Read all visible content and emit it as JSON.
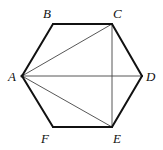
{
  "diagram": {
    "vertices": {
      "A": {
        "x": 22,
        "y": 76,
        "label": "A",
        "lx": 8,
        "ly": 81
      },
      "B": {
        "x": 53,
        "y": 24,
        "label": "B",
        "lx": 43,
        "ly": 18
      },
      "C": {
        "x": 112,
        "y": 24,
        "label": "C",
        "lx": 113,
        "ly": 18
      },
      "D": {
        "x": 142,
        "y": 76,
        "label": "D",
        "lx": 146,
        "ly": 81
      },
      "E": {
        "x": 112,
        "y": 127,
        "label": "E",
        "lx": 113,
        "ly": 143
      },
      "F": {
        "x": 53,
        "y": 127,
        "label": "F",
        "lx": 41,
        "ly": 143
      }
    },
    "edges": [
      "AB",
      "BC",
      "CD",
      "DE",
      "EF",
      "FA"
    ],
    "diagonals": [
      "AC",
      "AD",
      "AE",
      "CE"
    ],
    "colors": {
      "edge": "#111111",
      "diagonal": "#444444"
    }
  }
}
